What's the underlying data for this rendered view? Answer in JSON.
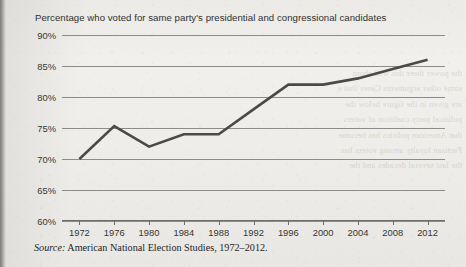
{
  "figure": {
    "title": "Percentage who voted for same party's presidential and congressional candidates",
    "source_label": "Source:",
    "source_text": "American National Election Studies, 1972–2012.",
    "line_color": "#4a4a48",
    "grid_color": "#8e8c88",
    "text_color": "#36352f",
    "page_color": "#eeedea"
  },
  "bleed_text": "the power there this will  about\nsome other arguments  Cases that a\nare given in the figure  below the\npolitical party coalition of voters\nthat American politics has become\nPartisan loyalty among voters has\nthe last several decades and the",
  "chart_data": {
    "type": "line",
    "title": "Percentage who voted for same party's presidential and congressional candidates",
    "subtitle": "",
    "xlabel": "",
    "ylabel": "",
    "x": [
      1972,
      1976,
      1980,
      1984,
      1988,
      1992,
      1996,
      2000,
      2004,
      2008,
      2012
    ],
    "values": [
      70,
      75.3,
      72,
      74,
      74,
      78,
      82,
      82,
      83,
      84.5,
      86
    ],
    "xtick_labels": [
      "1972",
      "1976",
      "1980",
      "1984",
      "1988",
      "1992",
      "1996",
      "2000",
      "2004",
      "2008",
      "2012"
    ],
    "ytick_labels": [
      "90%",
      "85%",
      "80%",
      "75%",
      "70%",
      "65%",
      "60%"
    ],
    "ytick_values": [
      90,
      85,
      80,
      75,
      70,
      65,
      60
    ],
    "ylim": [
      60,
      90
    ],
    "xlim": [
      1970,
      2014
    ],
    "grid": true,
    "grid_axis": "y",
    "legend": false,
    "legend_position": "none",
    "series": [
      {
        "name": "Percentage voting same party",
        "values": [
          70,
          75.3,
          72,
          74,
          74,
          78,
          82,
          82,
          83,
          84.5,
          86
        ]
      }
    ]
  }
}
